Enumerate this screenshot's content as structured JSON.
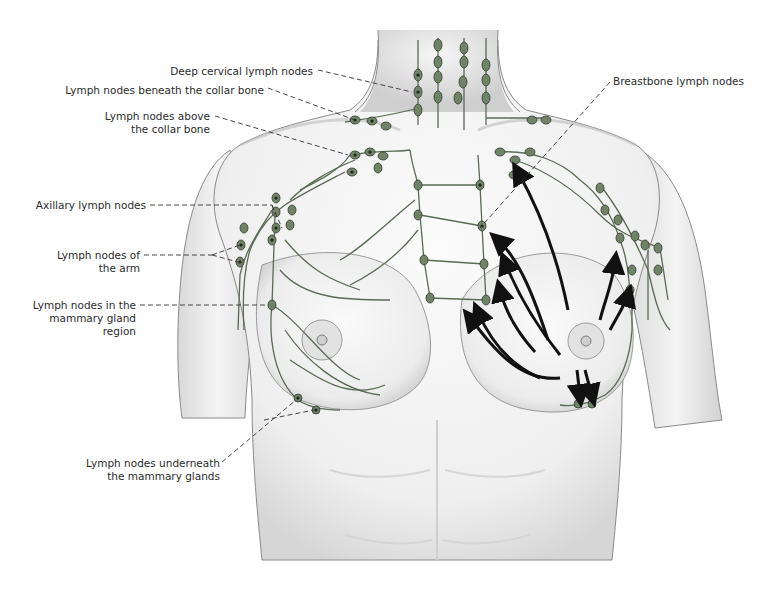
{
  "diagram": {
    "colors": {
      "skin": "#f2f2f2",
      "skin_shade": "#c9c9c9",
      "outline": "#6e6e6e",
      "vessel": "#5a6a55",
      "node_fill": "#6f8466",
      "node_core": "#1c241a",
      "leader": "#333333",
      "arrow": "#111111",
      "text": "#2b2b2b"
    },
    "labels": {
      "deep_cervical": [
        "Deep cervical lymph nodes"
      ],
      "beneath_collar": [
        "Lymph nodes beneath the collar bone"
      ],
      "above_collar": [
        "Lymph nodes above",
        "the collar bone"
      ],
      "axillary": [
        "Axillary lymph nodes"
      ],
      "arm": [
        "Lymph nodes of",
        "the arm"
      ],
      "mammary_region": [
        "Lymph nodes in the",
        "mammary gland",
        "region"
      ],
      "underneath_mammary": [
        "Lymph nodes underneath",
        "the mammary glands"
      ],
      "breastbone": [
        "Breastbone lymph nodes"
      ]
    },
    "annotation": "Arrows on the left breast indicate direction of lymph flow"
  }
}
